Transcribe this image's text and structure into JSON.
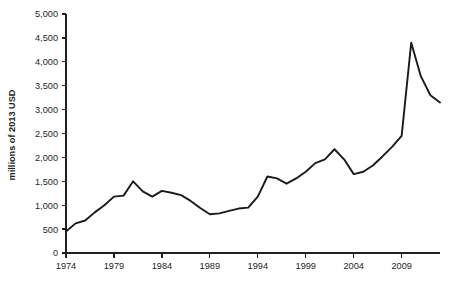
{
  "chart_data": {
    "type": "line",
    "title": "",
    "subtitle": "",
    "xlabel": "",
    "ylabel": "millions of 2013 USD",
    "xlim": [
      1974,
      2013
    ],
    "ylim": [
      0,
      5000
    ],
    "grid": false,
    "legend": null,
    "y_ticks": [
      0,
      500,
      1000,
      1500,
      2000,
      2500,
      3000,
      3500,
      4000,
      4500,
      5000
    ],
    "y_tick_labels": [
      "0",
      "500",
      "1,000",
      "1,500",
      "2,000",
      "2,500",
      "3,000",
      "3,500",
      "4,000",
      "4,500",
      "5,000"
    ],
    "x_ticks": [
      1974,
      1979,
      1984,
      1989,
      1994,
      1999,
      2004,
      2009
    ],
    "x_tick_labels": [
      "1974",
      "1979",
      "1984",
      "1989",
      "1994",
      "1999",
      "2004",
      "2009"
    ],
    "line_color": "#1a1a1a",
    "x": [
      1974,
      1975,
      1976,
      1977,
      1978,
      1979,
      1980,
      1981,
      1982,
      1983,
      1984,
      1985,
      1986,
      1987,
      1988,
      1989,
      1990,
      1991,
      1992,
      1993,
      1994,
      1995,
      1996,
      1997,
      1998,
      1999,
      2000,
      2001,
      2002,
      2003,
      2004,
      2005,
      2006,
      2007,
      2008,
      2009,
      2010,
      2011,
      2012,
      2013
    ],
    "values": [
      450,
      620,
      680,
      850,
      1000,
      1180,
      1200,
      1500,
      1290,
      1180,
      1300,
      1260,
      1210,
      1090,
      940,
      810,
      830,
      880,
      930,
      950,
      1180,
      1600,
      1560,
      1450,
      1560,
      1700,
      1880,
      1960,
      2170,
      1960,
      1650,
      1700,
      1830,
      2020,
      2220,
      2450,
      4400,
      3700,
      3300,
      3150
    ],
    "series": [
      {
        "name": "millions of 2013 USD",
        "values": [
          450,
          620,
          680,
          850,
          1000,
          1180,
          1200,
          1500,
          1290,
          1180,
          1300,
          1260,
          1210,
          1090,
          940,
          810,
          830,
          880,
          930,
          950,
          1180,
          1600,
          1560,
          1450,
          1560,
          1700,
          1880,
          1960,
          2170,
          1960,
          1650,
          1700,
          1830,
          2020,
          2220,
          2450,
          4400,
          3700,
          3300,
          3150
        ]
      }
    ],
    "annotations": []
  }
}
